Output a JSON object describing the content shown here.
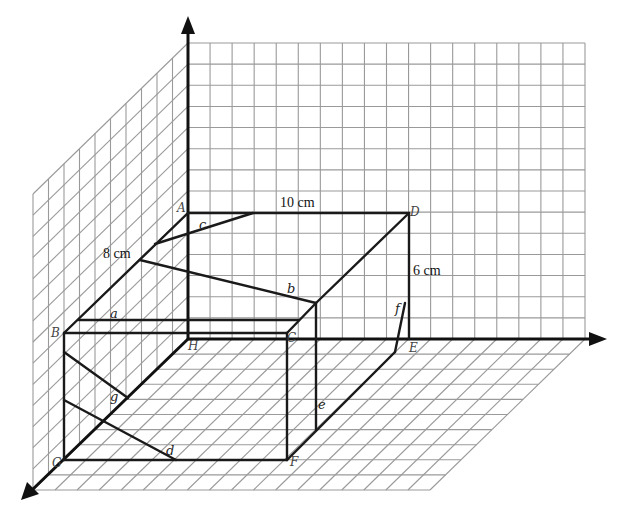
{
  "figure": {
    "dimensions": {
      "length": "10 cm",
      "depth": "8 cm",
      "height": "6 cm"
    },
    "vertices": {
      "A": "A",
      "B": "B",
      "C": "C",
      "D": "D",
      "E": "E",
      "F": "F",
      "G": "G",
      "H": "H"
    },
    "segments": {
      "a": "a",
      "b": "b",
      "c": "c",
      "d": "d",
      "e": "e",
      "f": "f",
      "g": "g"
    }
  },
  "colors": {
    "grid": "#9a9a9a",
    "edges": "#1a1a1a",
    "background": "#ffffff"
  }
}
